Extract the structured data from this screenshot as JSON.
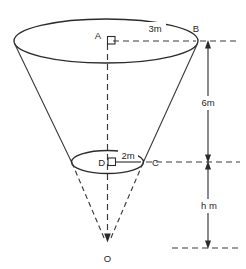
{
  "figure": {
    "colors": {
      "stroke": "#2b2b2b",
      "dashed": "#3a3a3a",
      "background": "#ffffff",
      "text": "#1f1f1f"
    }
  },
  "points": {
    "a": "A",
    "b": "B",
    "c": "C",
    "d": "D",
    "o": "O"
  },
  "dimensions": {
    "top_radius": "3m",
    "lower_radius": "2m",
    "upper_height": "6m",
    "lower_height": "h m"
  }
}
